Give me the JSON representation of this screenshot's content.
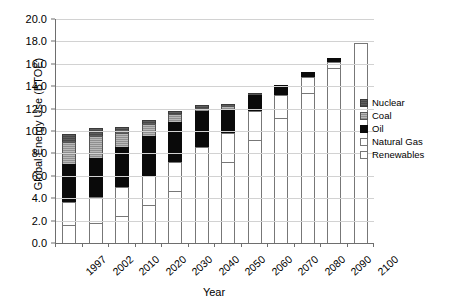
{
  "chart_data": {
    "type": "bar",
    "stacked": true,
    "title": "",
    "xlabel": "Year",
    "ylabel": "Global Energy Use (BTOE)",
    "ylim": [
      0.0,
      20.0
    ],
    "ytick_step": 2.0,
    "ytick_labels": [
      "20.0",
      "18.0",
      "16.0",
      "14.0",
      "12.0",
      "10.0",
      "8.0",
      "6.0",
      "4.0",
      "2.0",
      "0.0"
    ],
    "grid": true,
    "legend_position": "right",
    "categories": [
      "1997",
      "2002",
      "2010",
      "2020",
      "2030",
      "2040",
      "2050",
      "2060",
      "2070",
      "2080",
      "2090",
      "2100"
    ],
    "series": [
      {
        "name": "Renewables",
        "color": "#ffffff",
        "values": [
          1.6,
          1.8,
          2.4,
          3.4,
          4.6,
          6.0,
          7.2,
          9.2,
          11.2,
          13.4,
          15.6,
          17.9
        ]
      },
      {
        "name": "Natural Gas",
        "color": "#ffffff",
        "values": [
          2.1,
          2.3,
          2.6,
          2.6,
          2.6,
          2.6,
          2.6,
          2.6,
          2.0,
          1.4,
          0.6,
          0.0
        ]
      },
      {
        "name": "Oil",
        "color": "#0a0a0a",
        "values": [
          3.4,
          3.5,
          3.6,
          3.6,
          3.6,
          3.2,
          2.2,
          1.4,
          0.9,
          0.5,
          0.3,
          0.0
        ]
      },
      {
        "name": "Coal",
        "color": "#9b9b9b",
        "values": [
          1.9,
          2.0,
          1.2,
          1.0,
          0.7,
          0.3,
          0.2,
          0.1,
          0.0,
          0.0,
          0.0,
          0.0
        ]
      },
      {
        "name": "Nuclear",
        "color": "#525252",
        "values": [
          0.7,
          0.7,
          0.6,
          0.4,
          0.3,
          0.2,
          0.2,
          0.1,
          0.0,
          0.0,
          0.0,
          0.0
        ]
      }
    ],
    "totals": [
      9.7,
      10.3,
      10.4,
      11.0,
      11.8,
      12.3,
      12.4,
      13.4,
      14.1,
      15.3,
      16.5,
      17.9
    ]
  },
  "legend": {
    "items": [
      {
        "label": "Nuclear",
        "swatch": "nuclear"
      },
      {
        "label": "Coal",
        "swatch": "coal"
      },
      {
        "label": "Oil",
        "swatch": "oil"
      },
      {
        "label": "Natural Gas",
        "swatch": "gas"
      },
      {
        "label": "Renewables",
        "swatch": "renew"
      }
    ]
  }
}
